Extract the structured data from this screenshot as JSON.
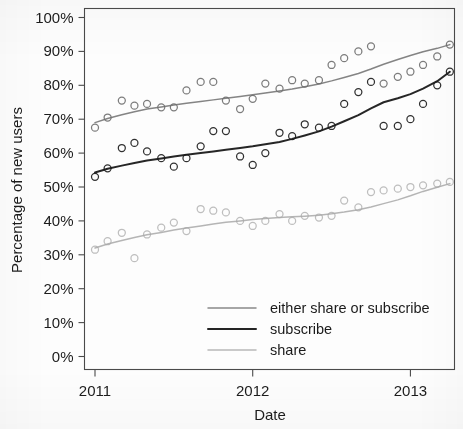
{
  "chart_data": {
    "type": "scatter",
    "title": "",
    "subtitle": "",
    "xlabel": "Date",
    "ylabel": "Percentage of new users",
    "grid": false,
    "legend_position": "bottom-right inside plot area",
    "xlim": [
      2011.0,
      2013.27
    ],
    "ylim": [
      0,
      100
    ],
    "x_tick_labels": [
      "2011",
      "2012",
      "2013"
    ],
    "x_tick_values": [
      2011,
      2012,
      2013
    ],
    "y_tick_labels": [
      "0%",
      "10%",
      "20%",
      "30%",
      "40%",
      "50%",
      "60%",
      "70%",
      "80%",
      "90%",
      "100%"
    ],
    "y_tick_values": [
      0,
      10,
      20,
      30,
      40,
      50,
      60,
      70,
      80,
      90,
      100
    ],
    "y_unit": "percent",
    "marker": "open-circle",
    "series": [
      {
        "name": "either share or subscribe",
        "color": "#6e6e6e",
        "line_width": 1.5,
        "trend_start_value": 69,
        "trend_end_value": 92,
        "x": [
          2011.0,
          2011.08,
          2011.17,
          2011.25,
          2011.33,
          2011.42,
          2011.5,
          2011.58,
          2011.67,
          2011.75,
          2011.83,
          2011.92,
          2012.0,
          2012.08,
          2012.17,
          2012.25,
          2012.33,
          2012.42,
          2012.5,
          2012.58,
          2012.67,
          2012.75,
          2012.83,
          2012.92,
          2013.0,
          2013.08,
          2013.17,
          2013.25
        ],
        "values": [
          67.5,
          70.5,
          75.5,
          74.0,
          74.5,
          73.5,
          73.5,
          78.5,
          81.0,
          81.0,
          75.5,
          73.0,
          76.0,
          80.5,
          79.0,
          81.5,
          80.5,
          81.5,
          86.0,
          88.0,
          90.0,
          91.5,
          80.5,
          82.5,
          84.0,
          86.0,
          88.5,
          92.0
        ],
        "trend": [
          69.0,
          70.2,
          71.3,
          72.2,
          73.0,
          73.6,
          74.2,
          74.7,
          75.2,
          75.7,
          76.2,
          76.7,
          77.2,
          77.7,
          78.3,
          78.9,
          79.6,
          80.4,
          81.3,
          82.3,
          83.5,
          84.8,
          86.2,
          87.6,
          88.8,
          89.9,
          90.9,
          92.0
        ]
      },
      {
        "name": "subscribe",
        "color": "#1a1a1a",
        "line_width": 2.0,
        "trend_start_value": 54,
        "trend_end_value": 84,
        "x": [
          2011.0,
          2011.08,
          2011.17,
          2011.25,
          2011.33,
          2011.42,
          2011.5,
          2011.58,
          2011.67,
          2011.75,
          2011.83,
          2011.92,
          2012.0,
          2012.08,
          2012.17,
          2012.25,
          2012.33,
          2012.42,
          2012.5,
          2012.58,
          2012.67,
          2012.75,
          2012.83,
          2012.92,
          2013.0,
          2013.08,
          2013.17,
          2013.25
        ],
        "values": [
          53.0,
          55.5,
          61.5,
          63.0,
          60.5,
          58.5,
          56.0,
          58.5,
          62.0,
          66.5,
          66.5,
          59.0,
          56.5,
          60.0,
          66.0,
          65.0,
          68.5,
          67.5,
          68.0,
          74.5,
          78.0,
          81.0,
          68.0,
          68.0,
          70.0,
          74.5,
          80.0,
          84.0
        ],
        "trend": [
          54.3,
          55.4,
          56.3,
          57.1,
          57.8,
          58.4,
          59.0,
          59.5,
          60.0,
          60.5,
          61.0,
          61.5,
          62.0,
          62.6,
          63.3,
          64.2,
          65.2,
          66.4,
          67.8,
          69.4,
          71.2,
          73.2,
          75.0,
          76.2,
          77.4,
          79.0,
          81.2,
          84.0
        ]
      },
      {
        "name": "share",
        "color": "#a8a8a8",
        "line_width": 1.5,
        "trend_start_value": 32,
        "trend_end_value": 51,
        "x": [
          2011.0,
          2011.08,
          2011.17,
          2011.25,
          2011.33,
          2011.42,
          2011.5,
          2011.58,
          2011.67,
          2011.75,
          2011.83,
          2011.92,
          2012.0,
          2012.08,
          2012.17,
          2012.25,
          2012.33,
          2012.42,
          2012.5,
          2012.58,
          2012.67,
          2012.75,
          2012.83,
          2012.92,
          2013.0,
          2013.08,
          2013.17,
          2013.25
        ],
        "values": [
          31.5,
          34.0,
          36.5,
          29.0,
          36.0,
          38.0,
          39.5,
          37.0,
          43.5,
          43.0,
          42.5,
          40.0,
          38.5,
          40.0,
          42.0,
          40.0,
          41.5,
          41.0,
          41.5,
          46.0,
          44.0,
          48.5,
          49.0,
          49.5,
          50.0,
          50.5,
          51.0,
          51.5
        ],
        "trend": [
          32.0,
          33.2,
          34.2,
          35.1,
          35.9,
          36.6,
          37.3,
          37.9,
          38.5,
          39.1,
          39.6,
          40.0,
          40.4,
          40.7,
          41.0,
          41.2,
          41.4,
          41.7,
          42.1,
          42.6,
          43.3,
          44.1,
          45.1,
          46.2,
          47.4,
          48.7,
          49.9,
          51.0
        ]
      }
    ]
  },
  "legend": {
    "items": [
      {
        "label": "either share or subscribe"
      },
      {
        "label": "subscribe"
      },
      {
        "label": "share"
      }
    ]
  }
}
